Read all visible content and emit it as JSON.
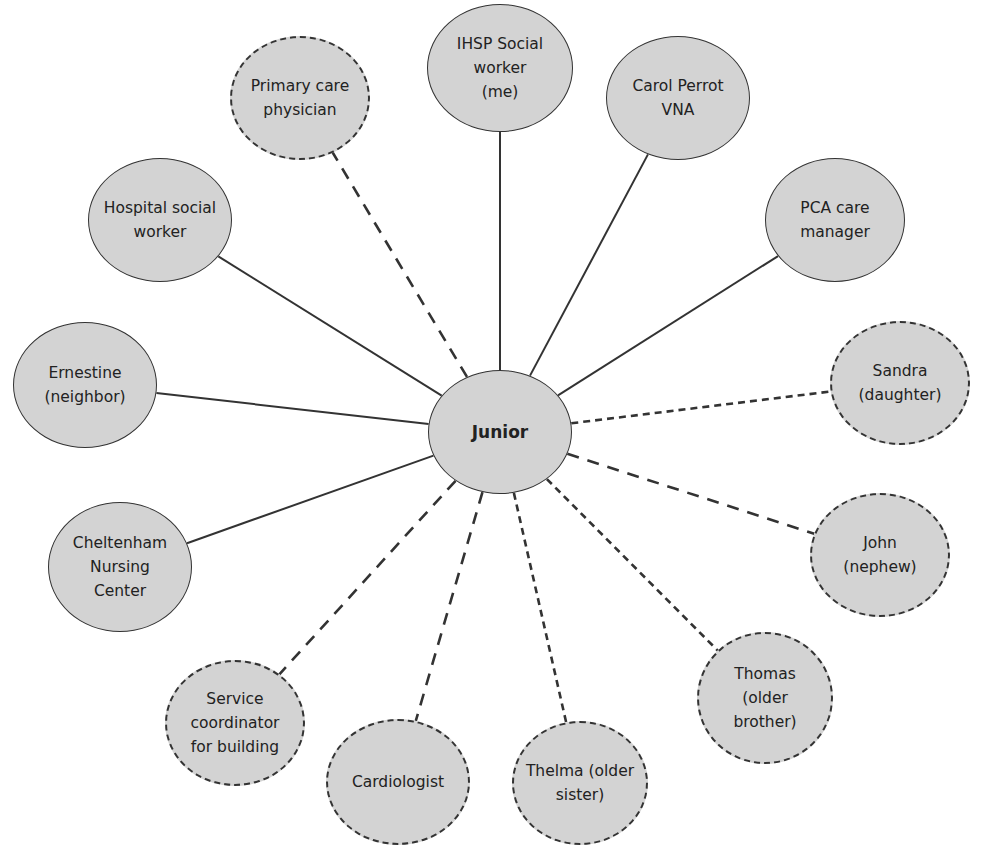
{
  "diagram": {
    "type": "ecomap",
    "colors": {
      "node_fill": "#d3d3d3",
      "stroke": "#333333",
      "background": "#ffffff"
    },
    "center": {
      "id": "junior",
      "label": "Junior",
      "cx": 500,
      "cy": 432,
      "rx": 72,
      "ry": 62
    },
    "nodes": [
      {
        "id": "ihsp",
        "label": "IHSP Social\nworker\n(me)",
        "cx": 500,
        "cy": 68,
        "rx": 73,
        "ry": 64,
        "border": "solid",
        "edge": "solid"
      },
      {
        "id": "primary-care",
        "label": "Primary care\nphysician",
        "cx": 300,
        "cy": 98,
        "rx": 70,
        "ry": 62,
        "border": "dashed",
        "edge": "long-dash"
      },
      {
        "id": "carol",
        "label": "Carol Perrot\nVNA",
        "cx": 678,
        "cy": 98,
        "rx": 72,
        "ry": 62,
        "border": "solid",
        "edge": "solid"
      },
      {
        "id": "pca",
        "label": "PCA care\nmanager",
        "cx": 835,
        "cy": 220,
        "rx": 70,
        "ry": 62,
        "border": "solid",
        "edge": "solid"
      },
      {
        "id": "hospital",
        "label": "Hospital social\nworker",
        "cx": 160,
        "cy": 220,
        "rx": 72,
        "ry": 62,
        "border": "solid",
        "edge": "solid"
      },
      {
        "id": "ernestine",
        "label": "Ernestine\n(neighbor)",
        "cx": 85,
        "cy": 385,
        "rx": 72,
        "ry": 63,
        "border": "solid",
        "edge": "solid"
      },
      {
        "id": "sandra",
        "label": "Sandra\n(daughter)",
        "cx": 900,
        "cy": 383,
        "rx": 70,
        "ry": 62,
        "border": "dashed",
        "edge": "short-dash"
      },
      {
        "id": "cheltenham",
        "label": "Cheltenham\nNursing\nCenter",
        "cx": 120,
        "cy": 567,
        "rx": 72,
        "ry": 65,
        "border": "solid",
        "edge": "solid"
      },
      {
        "id": "john",
        "label": "John\n(nephew)",
        "cx": 880,
        "cy": 555,
        "rx": 70,
        "ry": 62,
        "border": "dashed",
        "edge": "long-dash"
      },
      {
        "id": "service",
        "label": "Service\ncoordinator\nfor building",
        "cx": 235,
        "cy": 723,
        "rx": 70,
        "ry": 63,
        "border": "dashed",
        "edge": "long-dash"
      },
      {
        "id": "thomas",
        "label": "Thomas\n(older\nbrother)",
        "cx": 765,
        "cy": 698,
        "rx": 68,
        "ry": 66,
        "border": "dashed",
        "edge": "short-dash"
      },
      {
        "id": "cardiologist",
        "label": "Cardiologist",
        "cx": 398,
        "cy": 782,
        "rx": 72,
        "ry": 63,
        "border": "dashed",
        "edge": "long-dash"
      },
      {
        "id": "thelma",
        "label": "Thelma (older\nsister)",
        "cx": 580,
        "cy": 783,
        "rx": 68,
        "ry": 62,
        "border": "dashed",
        "edge": "short-dash"
      }
    ]
  }
}
